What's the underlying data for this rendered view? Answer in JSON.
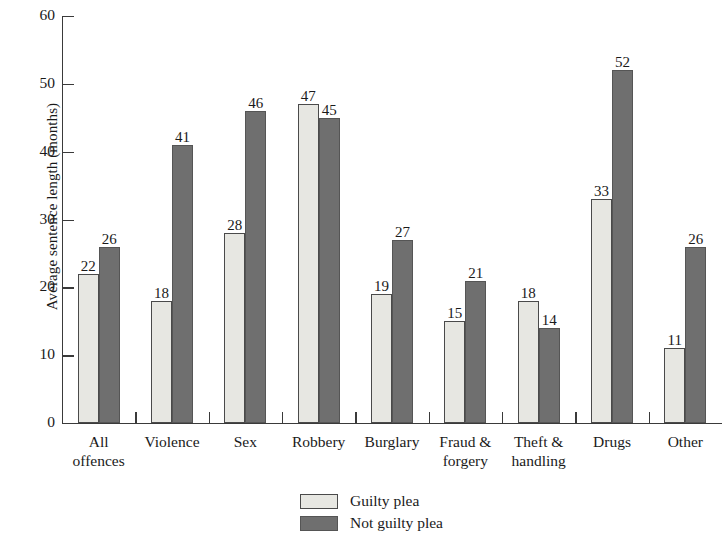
{
  "chart_data": {
    "type": "bar",
    "title": "",
    "xlabel": "",
    "ylabel": "Average sentence length (months)",
    "ylim": [
      0,
      60
    ],
    "yticks": [
      0,
      10,
      20,
      30,
      40,
      50,
      60
    ],
    "grid": false,
    "legend_position": "bottom-center",
    "categories": [
      "All offences",
      "Violence",
      "Sex",
      "Robbery",
      "Burglary",
      "Fraud & forgery",
      "Theft & handling",
      "Drugs",
      "Other"
    ],
    "category_lines": [
      [
        "All",
        "offences"
      ],
      [
        "Violence",
        ""
      ],
      [
        "Sex",
        ""
      ],
      [
        "Robbery",
        ""
      ],
      [
        "Burglary",
        ""
      ],
      [
        "Fraud &",
        "forgery"
      ],
      [
        "Theft &",
        "handling"
      ],
      [
        "Drugs",
        ""
      ],
      [
        "Other",
        ""
      ]
    ],
    "series": [
      {
        "name": "Guilty plea",
        "color": "#e7e7e2",
        "values": [
          22,
          18,
          28,
          47,
          19,
          15,
          18,
          33,
          11
        ]
      },
      {
        "name": "Not guilty plea",
        "color": "#6f6f6f",
        "values": [
          26,
          41,
          46,
          45,
          27,
          21,
          14,
          52,
          26
        ]
      }
    ]
  },
  "legend": {
    "items": [
      {
        "label": "Guilty plea",
        "swatch": "guilty"
      },
      {
        "label": "Not guilty plea",
        "swatch": "notguilty"
      }
    ]
  }
}
